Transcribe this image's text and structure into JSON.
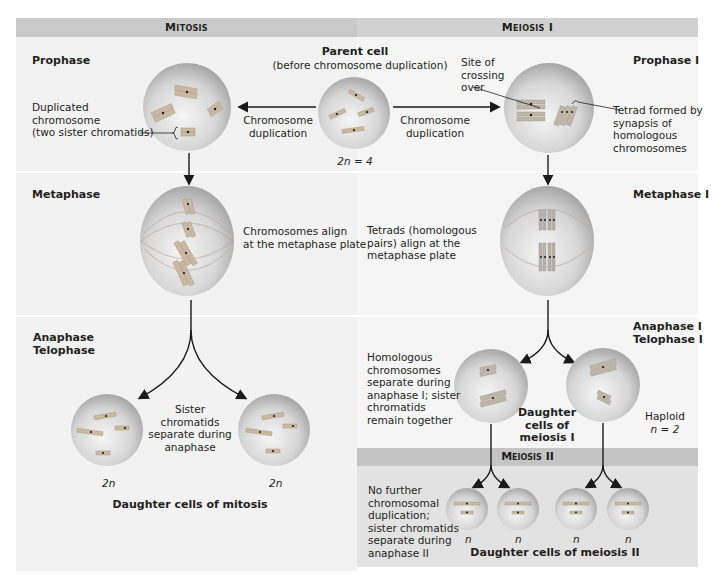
{
  "headers": {
    "mitosis": "Mitosis",
    "meiosis1": "Meiosis I",
    "meiosis2": "Meiosis II"
  },
  "phases": {
    "prophase": "Prophase",
    "metaphase": "Metaphase",
    "anaphase": "Anaphase",
    "telophase": "Telophase",
    "prophase1": "Prophase I",
    "metaphase1": "Metaphase I",
    "anaphase1": "Anaphase I",
    "telophase1": "Telophase I"
  },
  "parent_cell": {
    "title": "Parent cell",
    "subtitle": "(before chromosome duplication)",
    "ploidy": "2n = 4"
  },
  "labels": {
    "duplicated_chromosome": [
      "Duplicated",
      "chromosome",
      "(two sister chromatids)"
    ],
    "chromosome_duplication_left": [
      "Chromosome",
      "duplication"
    ],
    "chromosome_duplication_right": [
      "Chromosome",
      "duplication"
    ],
    "site_of_crossing_over": [
      "Site of",
      "crossing",
      "over"
    ],
    "tetrad_formed": [
      "Tetrad formed by",
      "synapsis of",
      "homologous",
      "chromosomes"
    ],
    "chromosomes_align": [
      "Chromosomes align",
      "at the metaphase plate"
    ],
    "tetrads_align": [
      "Tetrads (homologous",
      "pairs) align at the",
      "metaphase plate"
    ],
    "sister_chromatids_separate": [
      "Sister chromatids",
      "separate during",
      "anaphase"
    ],
    "homologous_separate": [
      "Homologous",
      "chromosomes",
      "separate during",
      "anaphase I; sister",
      "chromatids",
      "remain together"
    ],
    "daughter_cells_meiosis1": [
      "Daughter",
      "cells of",
      "meiosis I"
    ],
    "haploid": [
      "Haploid",
      "n = 2"
    ],
    "no_further_duplication": [
      "No further",
      "chromosomal",
      "duplication;",
      "sister chromatids",
      "separate during",
      "anaphase II"
    ],
    "mitosis_daughter_ploidy_left": "2n",
    "mitosis_daughter_ploidy_right": "2n",
    "daughter_cells_mitosis": "Daughter cells of mitosis",
    "meiosis2_ploidy": [
      "n",
      "n",
      "n",
      "n"
    ],
    "daughter_cells_meiosis2": "Daughter cells of meiosis II"
  },
  "colors": {
    "header_mitosis": "#c9c9c9",
    "header_meiosis": "#d1d1d1",
    "meiosis2_band": "#c4c4c4",
    "meiosis2_panel": "#e2e2e2",
    "panel_bg": "#f2f2f2",
    "cell_center": "#f4f4f4",
    "cell_edge": "#9a9a9a",
    "chromosome": "#c9b9a3",
    "centromere": "#1a1a1a"
  }
}
